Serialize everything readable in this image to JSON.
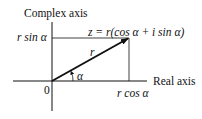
{
  "diagram": {
    "vertical_axis_label": "Complex axis",
    "horizontal_axis_label": "Real axis",
    "origin_label": "0",
    "y_projection_label": "r sin α",
    "x_projection_label": "r cos α",
    "vector_label": "r",
    "angle_label": "α",
    "equation": "z = r(cos α + i sin α)",
    "colors": {
      "line": "#111111",
      "background": "#ffffff"
    }
  }
}
